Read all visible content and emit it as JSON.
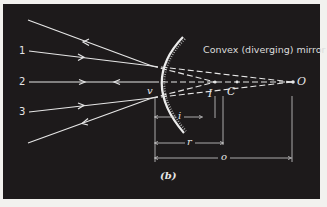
{
  "figure": {
    "title": "Convex (diverging) mirror",
    "caption": "(b)",
    "rays": [
      {
        "label": "1"
      },
      {
        "label": "2"
      },
      {
        "label": "3"
      }
    ],
    "points": {
      "vertex": "v",
      "image": "I",
      "center": "C",
      "object": "O"
    },
    "dimensions": {
      "image_distance": "i",
      "radius": "r",
      "object_distance": "o"
    },
    "colors": {
      "background": "#1d1a1b",
      "lines": "#e6e6e6",
      "page": "#f2f1ee"
    }
  }
}
